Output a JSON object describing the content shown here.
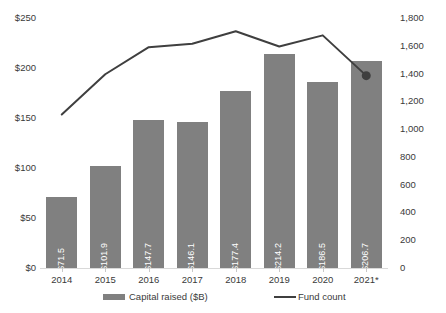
{
  "chart_data": {
    "type": "bar",
    "title": "",
    "subtitle": "",
    "xlabel": "",
    "ylabel": "",
    "categories": [
      "2014",
      "2015",
      "2016",
      "2017",
      "2018",
      "2019",
      "2020",
      "2021*"
    ],
    "series": [
      {
        "name": "Capital raised ($B)",
        "type": "bar",
        "axis": "left",
        "color": "#808080",
        "values": [
          71.5,
          101.9,
          147.7,
          146.1,
          177.4,
          214.2,
          186.5,
          206.7
        ],
        "data_labels": [
          "$71.5",
          "$101.9",
          "$147.7",
          "$146.1",
          "$177.4",
          "$214.2",
          "$186.5",
          "$206.7"
        ]
      },
      {
        "name": "Fund count",
        "type": "line",
        "axis": "right",
        "color": "#3f3f3f",
        "values": [
          1105,
          1395,
          1590,
          1615,
          1705,
          1595,
          1675,
          1385
        ],
        "marker_last": true
      }
    ],
    "left_axis": {
      "ticks": [
        "$0",
        "$50",
        "$100",
        "$150",
        "$200",
        "$250"
      ],
      "tick_values": [
        0,
        50,
        100,
        150,
        200,
        250
      ],
      "min": 0,
      "max": 250
    },
    "right_axis": {
      "ticks": [
        "0",
        "200",
        "400",
        "600",
        "800",
        "1,000",
        "1,200",
        "1,400",
        "1,600",
        "1,800"
      ],
      "tick_values": [
        0,
        200,
        400,
        600,
        800,
        1000,
        1200,
        1400,
        1600,
        1800
      ],
      "min": 0,
      "max": 1800
    },
    "grid": false,
    "legend": {
      "position": "bottom",
      "entries": [
        {
          "label": "Capital raised ($B)",
          "marker": "bar-swatch",
          "color": "#808080"
        },
        {
          "label": "Fund count",
          "marker": "line-swatch",
          "color": "#3f3f3f"
        }
      ]
    }
  }
}
